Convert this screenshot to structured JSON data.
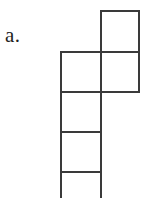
{
  "figure": {
    "label": "a.",
    "label_name": "figure-label-a",
    "background_color": "#ffffff",
    "line_color": "#3a3a3a",
    "fill_color": "#ffffff",
    "stroke_width": 2.2,
    "grid": {
      "cell_size": 40,
      "origin_x": 61,
      "origin_y": 11,
      "columns": 2,
      "rows": 5,
      "column_x": [
        61,
        101,
        139
      ],
      "row_y": [
        11,
        52,
        92,
        132,
        172,
        198
      ]
    },
    "cells": [
      {
        "id": "cell-r0-c1",
        "row": 0,
        "col": 1,
        "x": 101,
        "y": 11,
        "w": 38,
        "h": 41,
        "clipped": false
      },
      {
        "id": "cell-r1-c0",
        "row": 1,
        "col": 0,
        "x": 61,
        "y": 52,
        "w": 40,
        "h": 40,
        "clipped": false
      },
      {
        "id": "cell-r1-c1",
        "row": 1,
        "col": 1,
        "x": 101,
        "y": 52,
        "w": 38,
        "h": 40,
        "clipped": false
      },
      {
        "id": "cell-r2-c0",
        "row": 2,
        "col": 0,
        "x": 61,
        "y": 92,
        "w": 40,
        "h": 40,
        "clipped": false
      },
      {
        "id": "cell-r3-c0",
        "row": 3,
        "col": 0,
        "x": 61,
        "y": 132,
        "w": 40,
        "h": 40,
        "clipped": false
      },
      {
        "id": "cell-r4-c0",
        "row": 4,
        "col": 0,
        "x": 61,
        "y": 172,
        "w": 40,
        "h": 30,
        "clipped": true
      }
    ],
    "cell_count": 6
  }
}
